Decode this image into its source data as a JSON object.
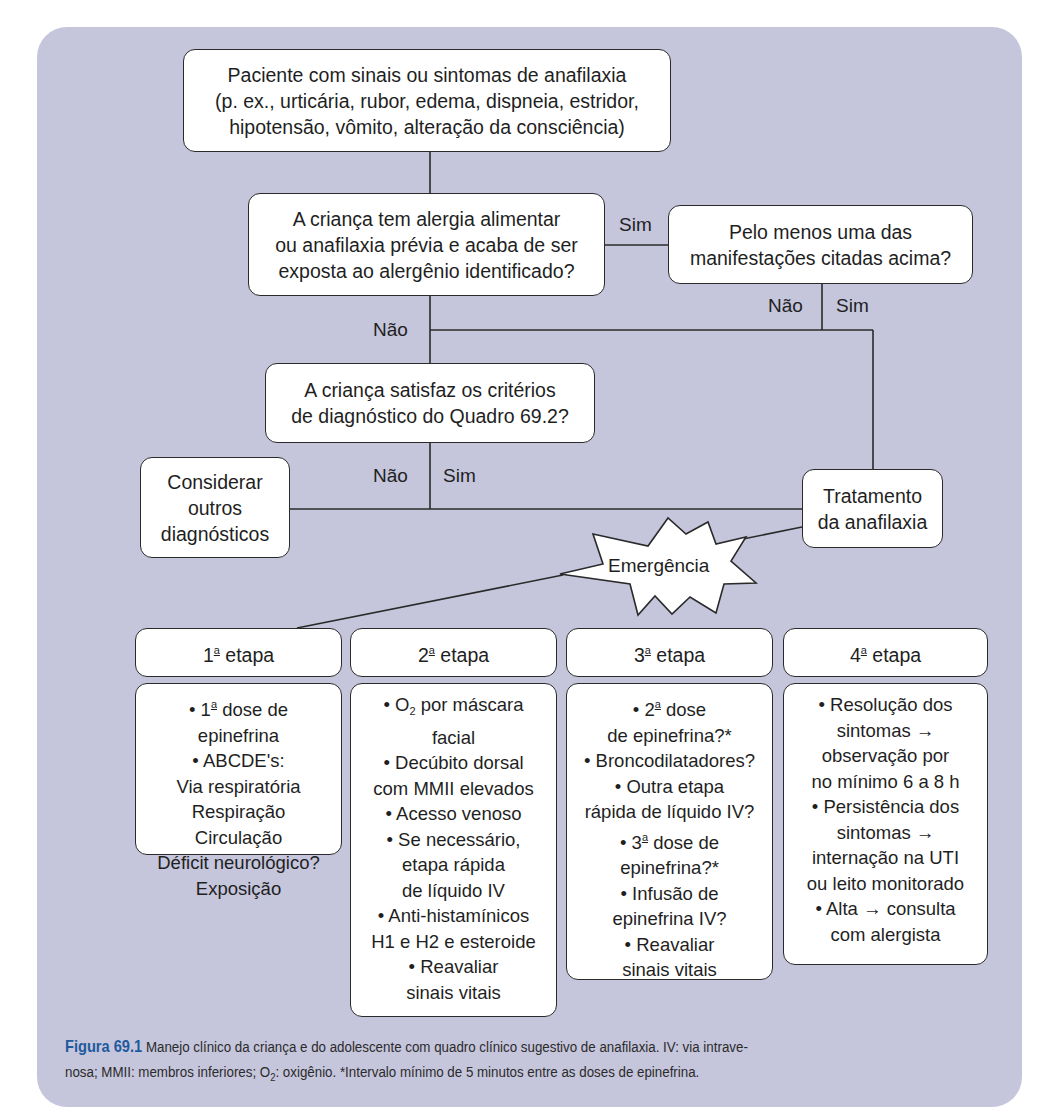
{
  "flowchart": {
    "start": {
      "lines": [
        "Paciente com sinais ou sintomas de anafilaxia",
        "(p. ex., urticária, rubor, edema, dispneia, estridor,",
        "hipotensão, vômito, alteração da consciência)"
      ]
    },
    "question1": {
      "lines": [
        "A criança tem alergia alimentar",
        "ou anafilaxia prévia e acaba de ser",
        "exposta ao alergênio identificado?"
      ]
    },
    "question1_yes_label": "Sim",
    "question_manifestations": {
      "lines": [
        "Pelo menos uma das",
        "manifestações citadas acima?"
      ]
    },
    "manifestations_no_label": "Não",
    "manifestations_yes_label": "Sim",
    "question1_no_label": "Não",
    "question2": {
      "lines": [
        "A criança satisfaz os critérios",
        "de diagnóstico do Quadro 69.2?"
      ]
    },
    "question2_no_label": "Não",
    "question2_yes_label": "Sim",
    "other_diagnoses": {
      "lines": [
        "Considerar",
        "outros",
        "diagnósticos"
      ]
    },
    "treatment": {
      "lines": [
        "Tratamento",
        "da anafilaxia"
      ]
    },
    "emergency_label": "Emergência",
    "stages": [
      {
        "ordinal": "1",
        "sup": "a",
        "title": "etapa",
        "items": [
          {
            "pre": "• ",
            "ord": "1",
            "sup": "a",
            "text": " dose de"
          },
          {
            "text": "epinefrina"
          },
          {
            "text": "• ABCDE's:"
          },
          {
            "text": "Via respiratória"
          },
          {
            "text": "Respiração"
          },
          {
            "text": "Circulação"
          },
          {
            "text": "Déficit neurológico?"
          },
          {
            "text": "Exposição"
          }
        ]
      },
      {
        "ordinal": "2",
        "sup": "a",
        "title": "etapa",
        "items": [
          {
            "pre": "• O",
            "sub": "2",
            "text": " por máscara"
          },
          {
            "text": "facial"
          },
          {
            "text": "• Decúbito dorsal"
          },
          {
            "text": "com MMII elevados"
          },
          {
            "text": "• Acesso venoso"
          },
          {
            "text": "• Se necessário,"
          },
          {
            "text": "etapa rápida"
          },
          {
            "text": "de líquido IV"
          },
          {
            "text": "• Anti-histamínicos"
          },
          {
            "text": "H1 e H2 e esteroide"
          },
          {
            "text": "• Reavaliar"
          },
          {
            "text": "sinais vitais"
          }
        ]
      },
      {
        "ordinal": "3",
        "sup": "a",
        "title": "etapa",
        "items": [
          {
            "pre": "• ",
            "ord": "2",
            "sup": "a",
            "text": " dose"
          },
          {
            "text": "de epinefrina?*"
          },
          {
            "text": "• Broncodilatadores?"
          },
          {
            "text": "• Outra etapa"
          },
          {
            "text": "rápida de líquido IV?"
          },
          {
            "pre": "• ",
            "ord": "3",
            "sup": "a",
            "text": " dose de"
          },
          {
            "text": "epinefrina?*"
          },
          {
            "text": "• Infusão de"
          },
          {
            "text": "epinefrina IV?"
          },
          {
            "text": "• Reavaliar"
          },
          {
            "text": "sinais vitais"
          }
        ]
      },
      {
        "ordinal": "4",
        "sup": "a",
        "title": "etapa",
        "items": [
          {
            "text": "• Resolução dos"
          },
          {
            "text": "sintomas →"
          },
          {
            "text": "observação por"
          },
          {
            "text": "no mínimo 6 a 8 h"
          },
          {
            "text": "• Persistência dos"
          },
          {
            "text": "sintomas →"
          },
          {
            "text": "internação na UTI"
          },
          {
            "text": "ou leito monitorado"
          },
          {
            "text": "• Alta → consulta"
          },
          {
            "text": "com alergista"
          }
        ]
      }
    ]
  },
  "caption": {
    "figure_label": "Figura 69.1",
    "line1": " Manejo clínico da criança e do adolescente com quadro clínico sugestivo de anafilaxia. IV: via intrave-",
    "line2_pre": "nosa; MMII: membros inferiores; O",
    "line2_sub": "2",
    "line2_post": ": oxigênio. *Intervalo mínimo de 5 minutos entre as doses de epinefrina."
  },
  "colors": {
    "panel_background": "#c5c5dc",
    "box_fill": "#ffffff",
    "line_color": "#2a2a2a",
    "figure_label": "#1f5a9c"
  }
}
